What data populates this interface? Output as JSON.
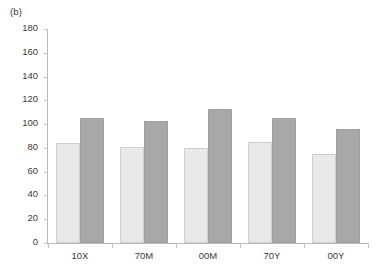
{
  "figure": {
    "panel_label": "(b)"
  },
  "chart_data": {
    "type": "bar",
    "title": "",
    "subtitle": "",
    "xlabel": "",
    "ylabel": "",
    "categories": [
      "10X",
      "70M",
      "00M",
      "70Y",
      "00Y"
    ],
    "series": [
      {
        "name": "series-1",
        "color": "#e9e9e9",
        "values": [
          84,
          81,
          80,
          85,
          75
        ]
      },
      {
        "name": "series-2",
        "color": "#a8a8a8",
        "values": [
          105,
          103,
          113,
          105,
          96
        ]
      }
    ],
    "ylim": [
      0,
      180
    ],
    "ytick_step": 20,
    "yticks": [
      0,
      20,
      40,
      60,
      80,
      100,
      120,
      140,
      160,
      180
    ],
    "ytick_labels": [
      "0",
      "20",
      "40",
      "60",
      "80",
      "100",
      "120",
      "140",
      "160",
      "180"
    ],
    "grid": false,
    "legend": false,
    "legend_position": "none",
    "annotations": [
      "(b)"
    ]
  }
}
